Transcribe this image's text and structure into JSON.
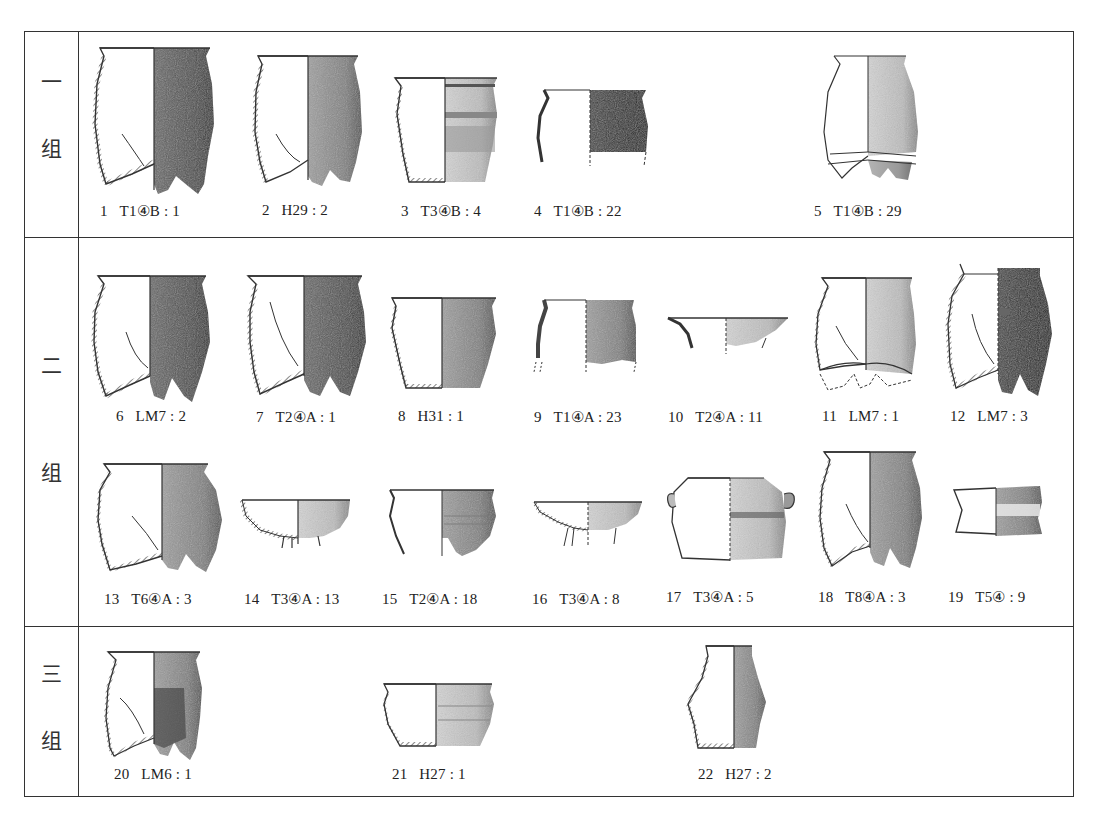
{
  "figure": {
    "groups": [
      {
        "id": "group-1",
        "label_top": "一",
        "label_bottom": "组"
      },
      {
        "id": "group-2",
        "label_top": "二",
        "label_bottom": "组"
      },
      {
        "id": "group-3",
        "label_top": "三",
        "label_bottom": "组"
      }
    ],
    "items": [
      {
        "num": "1",
        "label": "T1④B : 1"
      },
      {
        "num": "2",
        "label": "H29 : 2"
      },
      {
        "num": "3",
        "label": "T3④B : 4"
      },
      {
        "num": "4",
        "label": "T1④B : 22"
      },
      {
        "num": "5",
        "label": "T1④B : 29"
      },
      {
        "num": "6",
        "label": "LM7 : 2"
      },
      {
        "num": "7",
        "label": "T2④A : 1"
      },
      {
        "num": "8",
        "label": "H31 : 1"
      },
      {
        "num": "9",
        "label": "T1④A : 23"
      },
      {
        "num": "10",
        "label": "T2④A : 11"
      },
      {
        "num": "11",
        "label": "LM7 : 1"
      },
      {
        "num": "12",
        "label": "LM7 : 3"
      },
      {
        "num": "13",
        "label": "T6④A : 3"
      },
      {
        "num": "14",
        "label": "T3④A : 13"
      },
      {
        "num": "15",
        "label": "T2④A : 18"
      },
      {
        "num": "16",
        "label": "T3④A : 8"
      },
      {
        "num": "17",
        "label": "T3④A : 5"
      },
      {
        "num": "18",
        "label": "T8④A : 3"
      },
      {
        "num": "19",
        "label": "T5④ : 9"
      },
      {
        "num": "20",
        "label": "LM6 : 1"
      },
      {
        "num": "21",
        "label": "H27 : 1"
      },
      {
        "num": "22",
        "label": "H27 : 2"
      }
    ],
    "colors": {
      "line": "#333333",
      "shade_dark": "#3a3a3a",
      "shade_mid": "#7a7a7a",
      "shade_light": "#b8b8b8"
    }
  }
}
